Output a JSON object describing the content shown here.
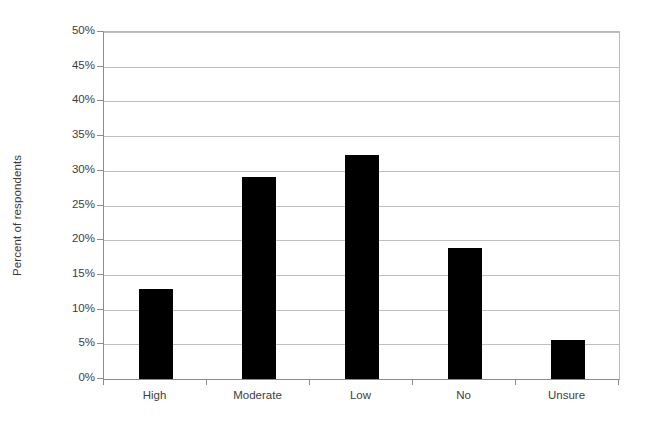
{
  "chart_data": {
    "type": "bar",
    "title": "",
    "subtitle": "",
    "xlabel": "",
    "ylabel": "Percent of respondents",
    "categories": [
      "High",
      "Moderate",
      "Low",
      "No",
      "Unsure"
    ],
    "values": [
      13.0,
      29.1,
      32.3,
      18.9,
      5.6
    ],
    "value_labels": [
      "13%",
      "29.1%",
      "32.3%",
      "18.9%",
      "5.6%"
    ],
    "series": [
      {
        "name": "Percent of respondents",
        "values": [
          13.0,
          29.1,
          32.3,
          18.9,
          5.6
        ],
        "color": "#000000"
      }
    ],
    "ylim": [
      0,
      50
    ],
    "ytick_values": [
      0,
      5,
      10,
      15,
      20,
      25,
      30,
      35,
      40,
      45,
      50
    ],
    "ytick_labels": [
      "0%",
      "5%",
      "10%",
      "15%",
      "20%",
      "25%",
      "30%",
      "35%",
      "40%",
      "45%",
      "50%"
    ],
    "grid": true,
    "grid_axis": "y",
    "legend": false,
    "legend_position": "none",
    "bar_color": "#000000",
    "grid_color": "#bfbfbf",
    "axis_color": "#8c8c8c",
    "background_color": "#ffffff",
    "annotations": []
  }
}
